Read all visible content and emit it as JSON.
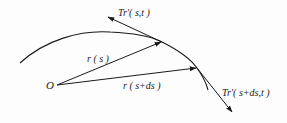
{
  "diagram": {
    "origin_label": "O",
    "vectors": [
      {
        "id": "r_s",
        "label": "r ( s )"
      },
      {
        "id": "r_s_ds",
        "label": "r ( s+ds )"
      }
    ],
    "tangents": [
      {
        "id": "t1",
        "label": "Tr′( s,t )"
      },
      {
        "id": "t2",
        "label": "Tr′( s+ds,t )"
      }
    ],
    "colors": {
      "stroke": "#1a1a1a",
      "background": "#fdfdfd"
    }
  }
}
